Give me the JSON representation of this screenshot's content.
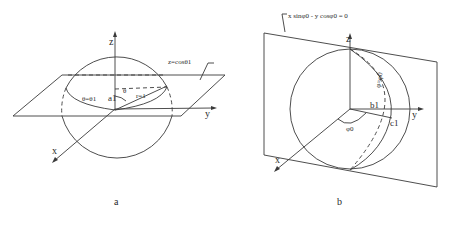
{
  "figure": {
    "panel_a": {
      "caption": "a",
      "axes": {
        "z": "z",
        "y": "y",
        "x": "x"
      },
      "plane_label": "z=cosθ1",
      "point_label": "a1",
      "radius_label": "r=1",
      "angle_label": "θ",
      "curve_label": "θ=θ1"
    },
    "panel_b": {
      "caption": "b",
      "axes": {
        "z": "z",
        "y": "y",
        "x": "x"
      },
      "plane_label": "x sinφ0 - y cosφ0 = 0",
      "point_b_label": "b1",
      "point_c_label": "c1",
      "angle_label": "φ0",
      "curve_label": "φ=φ0"
    },
    "footer_text": "Fig. ..."
  }
}
